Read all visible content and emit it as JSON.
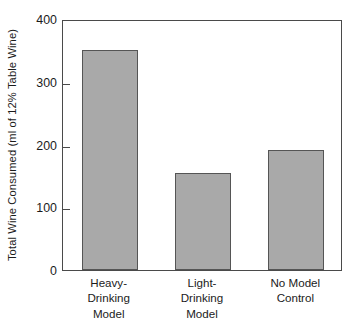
{
  "chart_data": {
    "type": "bar",
    "title": "",
    "subtitle": "",
    "xlabel": "",
    "ylabel": "Total Wine Consumed (ml of 12% Table Wine)",
    "categories": [
      "Heavy-Drinking Model",
      "Light-Drinking Model",
      "No Model Control"
    ],
    "category_lines": [
      [
        "Heavy-",
        "Drinking",
        "Model"
      ],
      [
        "Light-",
        "Drinking",
        "Model"
      ],
      [
        "No Model",
        "Control"
      ]
    ],
    "values": [
      350,
      155,
      192
    ],
    "ylim": [
      0,
      400
    ],
    "yticks": [
      0,
      100,
      200,
      300,
      400
    ],
    "ytick_labels": [
      "0",
      "100",
      "200",
      "300",
      "400"
    ],
    "grid": false,
    "legend": "none",
    "bar_color": "#a9a9a9",
    "bar_edge_color": "#555555",
    "axis_color": "#4a4a4a",
    "background_color": "#ffffff"
  }
}
